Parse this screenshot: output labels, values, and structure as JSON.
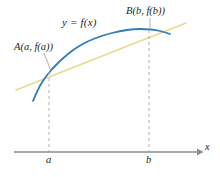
{
  "figure": {
    "background_color": "#ffffff"
  },
  "labels": {
    "curve_label": "y = f(x)",
    "point_a_label": "A(a, f(a))",
    "point_b_label": "B(b, f(b))",
    "tick_a": "a",
    "tick_b": "b",
    "axis_x": "x"
  },
  "colors": {
    "curve": "#2f7fbf",
    "secant": "#e4dc8c",
    "axis": "#8c8c8c",
    "dashed": "#b0b0b0",
    "leader": "#8c8c8c",
    "text": "#231f20"
  },
  "chart_data": {
    "type": "line",
    "xlabel": "x",
    "ylabel": "",
    "grid": false,
    "legend": "none",
    "axis": {
      "x_axis_y_px": 152,
      "x_axis_start_px": 14,
      "x_axis_end_px": 200,
      "arrow": "right"
    },
    "ticks": [
      {
        "label": "a",
        "x_px": 49
      },
      {
        "label": "b",
        "x_px": 149
      }
    ],
    "series": [
      {
        "name": "y = f(x)",
        "type": "curve",
        "color": "#2f7fbf",
        "points_px": [
          [
            33,
            101
          ],
          [
            38,
            89
          ],
          [
            44,
            79
          ],
          [
            52,
            69
          ],
          [
            62,
            59
          ],
          [
            74,
            49
          ],
          [
            88,
            41
          ],
          [
            104,
            35
          ],
          [
            120,
            31
          ],
          [
            134,
            29
          ],
          [
            146,
            29
          ],
          [
            156,
            30
          ],
          [
            164,
            32
          ],
          [
            170,
            34
          ]
        ]
      },
      {
        "name": "secant line AB",
        "type": "line",
        "color": "#e4dc8c",
        "points_px": [
          [
            16,
            90
          ],
          [
            186,
            23
          ]
        ]
      }
    ],
    "marked_points": [
      {
        "name": "A",
        "label": "A(a, f(a))",
        "x_px": 49,
        "y_px": 72
      },
      {
        "name": "B",
        "label": "B(b, f(b))",
        "x_px": 149,
        "y_px": 29
      }
    ],
    "dashed_verticals": [
      {
        "at": "a",
        "x_px": 49,
        "y_top_px": 72,
        "y_bottom_px": 152
      },
      {
        "at": "b",
        "x_px": 149,
        "y_top_px": 30,
        "y_bottom_px": 152
      }
    ],
    "leaders": [
      {
        "from": "A(a, f(a))",
        "x1_px": 44,
        "y1_px": 53,
        "x2_px": 51,
        "y2_px": 71
      },
      {
        "from": "B(b, f(b))",
        "x1_px": 150,
        "y1_px": 19,
        "x2_px": 150,
        "y2_px": 28
      }
    ]
  }
}
